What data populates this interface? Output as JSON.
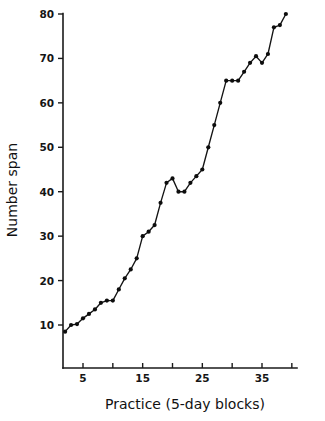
{
  "chart_data": {
    "type": "line",
    "title": "",
    "xlabel": "Practice (5-day blocks)",
    "ylabel": "Number span",
    "xlim": [
      1,
      39
    ],
    "ylim": [
      5,
      82
    ],
    "grid": false,
    "legend": null,
    "marker": "filled-circle",
    "color": "#0d0d0d",
    "x_ticks": [
      5,
      10,
      15,
      20,
      25,
      30,
      35,
      40
    ],
    "x_tick_labels": [
      "5",
      "",
      "15",
      "",
      "25",
      "",
      "35",
      ""
    ],
    "y_ticks": [
      10,
      20,
      30,
      40,
      50,
      60,
      70,
      80
    ],
    "y_tick_labels": [
      "10",
      "20",
      "30",
      "40",
      "50",
      "60",
      "70",
      "80"
    ],
    "x": [
      2,
      3,
      4,
      5,
      6,
      7,
      8,
      9,
      10,
      11,
      12,
      13,
      14,
      15,
      16,
      17,
      18,
      19,
      20,
      21,
      22,
      23,
      24,
      25,
      26,
      27,
      28,
      29,
      30,
      31,
      32,
      33,
      34,
      35,
      36,
      37,
      38,
      39
    ],
    "values": [
      8.5,
      10,
      10.2,
      11.5,
      12.5,
      13.5,
      15,
      15.5,
      15.5,
      18,
      20.5,
      22.5,
      25,
      30,
      31,
      32.5,
      37.5,
      42,
      43,
      40,
      40,
      42,
      43.5,
      45,
      50,
      55,
      60,
      65,
      65,
      65,
      67,
      69,
      70.5,
      69,
      71,
      77,
      77.5,
      80
    ],
    "series": [
      {
        "name": "Number span",
        "values": [
          8.5,
          10,
          10.2,
          11.5,
          12.5,
          13.5,
          15,
          15.5,
          15.5,
          18,
          20.5,
          22.5,
          25,
          30,
          31,
          32.5,
          37.5,
          42,
          43,
          40,
          40,
          42,
          43.5,
          45,
          50,
          55,
          60,
          65,
          65,
          65,
          67,
          69,
          70.5,
          69,
          71,
          77,
          77.5,
          80
        ]
      }
    ]
  },
  "axes": {
    "y_axis_name": "Number span",
    "x_axis_name": "Practice (5-day blocks)"
  }
}
